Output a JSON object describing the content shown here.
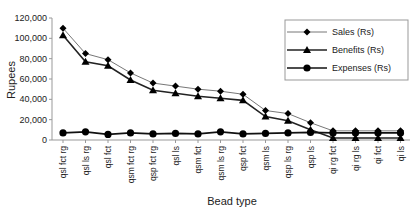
{
  "chart_data": {
    "type": "line",
    "title": "",
    "xlabel": "Bead type",
    "ylabel": "Rupees",
    "ylim": [
      0,
      120000
    ],
    "yticks": [
      0,
      20000,
      40000,
      60000,
      80000,
      100000,
      120000
    ],
    "ytick_labels": [
      "0",
      "20,000",
      "40,000",
      "60,000",
      "80,000",
      "100,000",
      "120,000"
    ],
    "grid": false,
    "legend_position": "upper right",
    "categories": [
      "qsl fct rg",
      "qsl ls rg",
      "qsl fct",
      "qsm fct rg",
      "qsp fct rg",
      "qsl ls",
      "qsm fct",
      "qsm ls rg",
      "qsp fct",
      "qsm ls",
      "qsp ls rg",
      "qsp ls",
      "qi rg fct",
      "qi rg ls",
      "qi fct",
      "qi ls"
    ],
    "series": [
      {
        "name": "Sales (Rs)",
        "marker": "diamond",
        "color": "#777777",
        "values": [
          110000,
          85000,
          79000,
          66000,
          56000,
          53000,
          50000,
          48000,
          45000,
          29000,
          26000,
          17000,
          9000,
          9000,
          9000,
          9000
        ]
      },
      {
        "name": "Benefits (Rs)",
        "marker": "triangle",
        "color": "#222222",
        "values": [
          103000,
          77000,
          73000,
          59000,
          49000,
          46000,
          43000,
          41000,
          39000,
          23000,
          19000,
          10000,
          2000,
          2000,
          2000,
          2000
        ]
      },
      {
        "name": "Expenses (Rs)",
        "marker": "circle",
        "color": "#111111",
        "values": [
          7000,
          8000,
          5500,
          7000,
          6000,
          6500,
          6000,
          8000,
          6000,
          6500,
          7000,
          7500,
          7000,
          7000,
          7000,
          7000
        ]
      }
    ]
  }
}
